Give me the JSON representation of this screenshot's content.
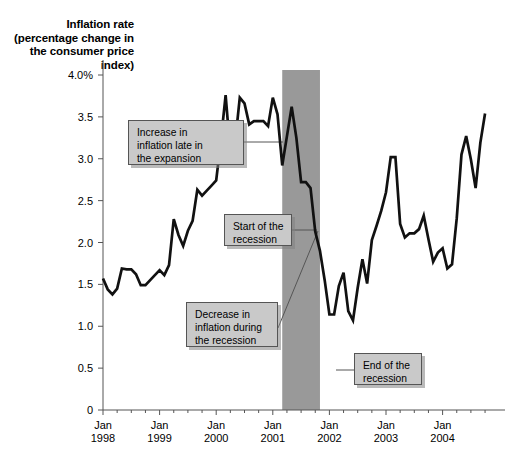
{
  "chart_data": {
    "type": "line",
    "title": "Inflation rate (percentage change in the consumer price index)",
    "ylabel_lines": [
      "Inflation rate",
      "(percentage change",
      "in the consumer",
      "price index)"
    ],
    "xlabel": "",
    "ylabel": "Inflation rate (percentage change in the consumer price index)",
    "ylim": [
      0,
      4.0
    ],
    "xlim": [
      "Jan 1998",
      "Oct 2004"
    ],
    "grid": false,
    "legend": null,
    "y_ticks": [
      0,
      0.5,
      1.0,
      1.5,
      2.0,
      2.5,
      3.0,
      3.5,
      4.0
    ],
    "y_tick_labels": [
      "0",
      "0.5",
      "1.0",
      "1.5",
      "2.0",
      "2.5",
      "3.0",
      "3.5",
      "4.0%"
    ],
    "x_tick_labels": [
      {
        "line1": "Jan",
        "line2": "1998"
      },
      {
        "line1": "Jan",
        "line2": "1999"
      },
      {
        "line1": "Jan",
        "line2": "2000"
      },
      {
        "line1": "Jan",
        "line2": "2001"
      },
      {
        "line1": "Jan",
        "line2": "2002"
      },
      {
        "line1": "Jan",
        "line2": "2003"
      },
      {
        "line1": "Jan",
        "line2": "2004"
      }
    ],
    "x_minor_ticks_per_year": 4,
    "series": [
      {
        "name": "Inflation rate (CPI percentage change)",
        "color": "#111111",
        "x": [
          "1998-01",
          "1998-02",
          "1998-03",
          "1998-04",
          "1998-05",
          "1998-06",
          "1998-07",
          "1998-08",
          "1998-09",
          "1998-10",
          "1998-11",
          "1998-12",
          "1999-01",
          "1999-02",
          "1999-03",
          "1999-04",
          "1999-05",
          "1999-06",
          "1999-07",
          "1999-08",
          "1999-09",
          "1999-10",
          "1999-11",
          "1999-12",
          "2000-01",
          "2000-02",
          "2000-03",
          "2000-04",
          "2000-05",
          "2000-06",
          "2000-07",
          "2000-08",
          "2000-09",
          "2000-10",
          "2000-11",
          "2000-12",
          "2001-01",
          "2001-02",
          "2001-03",
          "2001-04",
          "2001-05",
          "2001-06",
          "2001-07",
          "2001-08",
          "2001-09",
          "2001-10",
          "2001-11",
          "2001-12",
          "2002-01",
          "2002-02",
          "2002-03",
          "2002-04",
          "2002-05",
          "2002-06",
          "2002-07",
          "2002-08",
          "2002-09",
          "2002-10",
          "2002-11",
          "2002-12",
          "2003-01",
          "2003-02",
          "2003-03",
          "2003-04",
          "2003-05",
          "2003-06",
          "2003-07",
          "2003-08",
          "2003-09",
          "2003-10",
          "2003-11",
          "2003-12",
          "2004-01",
          "2004-02",
          "2004-03",
          "2004-04",
          "2004-05",
          "2004-06",
          "2004-07",
          "2004-08",
          "2004-09",
          "2004-10"
        ],
        "values": [
          1.57,
          1.44,
          1.38,
          1.45,
          1.69,
          1.68,
          1.68,
          1.62,
          1.49,
          1.49,
          1.55,
          1.61,
          1.67,
          1.61,
          1.73,
          2.28,
          2.09,
          1.96,
          2.14,
          2.26,
          2.63,
          2.56,
          2.62,
          2.68,
          2.74,
          3.22,
          3.76,
          3.07,
          3.19,
          3.73,
          3.66,
          3.41,
          3.45,
          3.45,
          3.45,
          3.39,
          3.73,
          3.53,
          2.92,
          3.27,
          3.62,
          3.25,
          2.72,
          2.72,
          2.65,
          2.13,
          1.9,
          1.55,
          1.14,
          1.14,
          1.48,
          1.64,
          1.18,
          1.07,
          1.46,
          1.8,
          1.51,
          2.03,
          2.2,
          2.38,
          2.6,
          3.02,
          3.02,
          2.22,
          2.06,
          2.11,
          2.11,
          2.16,
          2.32,
          2.04,
          1.77,
          1.88,
          1.93,
          1.69,
          1.74,
          2.29,
          3.05,
          3.27,
          2.99,
          2.65,
          3.19,
          3.54
        ],
        "min": 1.07,
        "max": 3.76
      }
    ],
    "shaded_regions": [
      {
        "name": "recession-band",
        "label": "Recession",
        "start": "2001-03",
        "end": "2001-11",
        "color": "#999999"
      }
    ],
    "annotations": [
      {
        "id": "increase-in-expansion",
        "text": "Increase in\ninflation late in\nthe expansion",
        "leader": {
          "x1": 244,
          "y1": 142,
          "x2": 283,
          "y2": 142
        }
      },
      {
        "id": "start-of-recession",
        "text": "Start of the\nrecession",
        "leader": {
          "x1": 292,
          "y1": 230,
          "x2": 317,
          "y2": 230
        }
      },
      {
        "id": "decrease-during-recession",
        "text": "Decrease in\ninflation during\nthe recession",
        "leader": {
          "x1": 278,
          "y1": 328,
          "x2": 318,
          "y2": 231
        }
      },
      {
        "id": "end-of-recession",
        "text": "End of the\nrecession",
        "leader": {
          "x1": 336,
          "y1": 370,
          "x2": 354,
          "y2": 370
        }
      }
    ]
  }
}
